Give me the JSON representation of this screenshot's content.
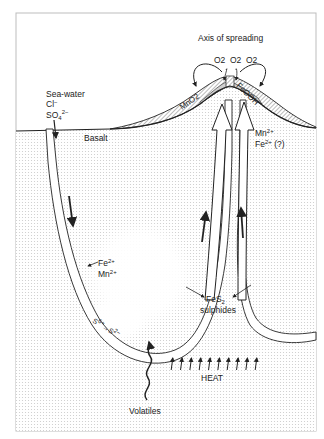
{
  "figure": {
    "title": "Axis of spreading",
    "oxygen_labels": [
      "O2",
      "O2",
      "O2"
    ],
    "deposits": {
      "left": "MnO2",
      "right": "FeOOH"
    },
    "seawater": {
      "title": "Sea-water",
      "ion1": "Cl",
      "ion1_charge": "−",
      "ion2": "SO",
      "ion2_sub": "4",
      "ion2_charge": "2−"
    },
    "basalt_label": "Basalt",
    "rising_ions": {
      "line1_main": "Mn",
      "line1_charge": "2+",
      "line2_main": "Fe",
      "line2_charge": "2+",
      "line2_note": " (?)"
    },
    "leached_ions": {
      "line1_main": "Fe",
      "line1_charge": "2+",
      "line2_main": "Mn",
      "line2_charge": "2+"
    },
    "sulphides": {
      "formula_main": "FeS",
      "formula_sub": "2",
      "label": "sulphides"
    },
    "sulphur_reduction": {
      "from": "S",
      "from_charge": "6+",
      "to": "S",
      "to_charge": "2−"
    },
    "heat_label": "HEAT",
    "heat_arrow_count": 10,
    "volatiles_label": "Volatiles",
    "colors": {
      "ink": "#222222",
      "dots": "#c9c9c9",
      "hatch": "#555555",
      "crest_fill": "#cfcfcf",
      "frame": "#bdbdbd"
    }
  }
}
